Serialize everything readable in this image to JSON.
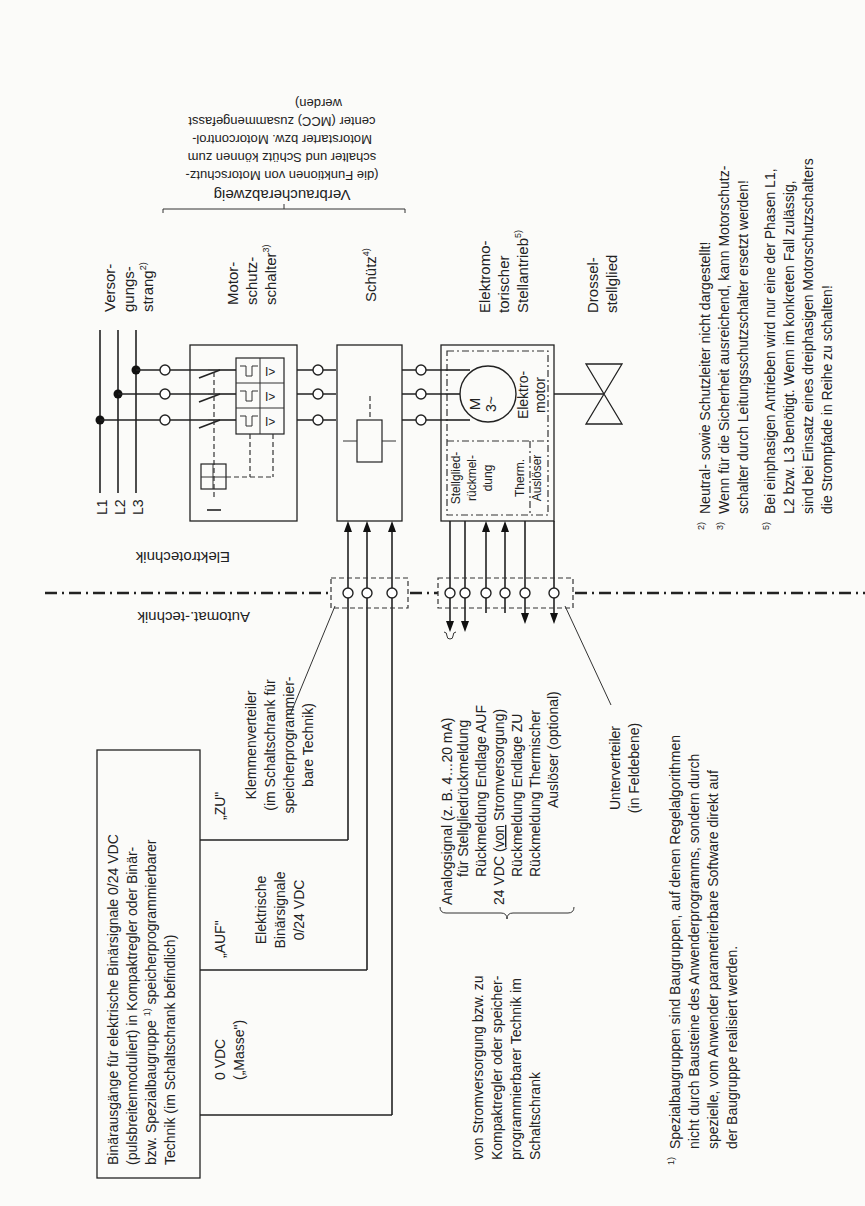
{
  "domains": {
    "upper": "Elektrotechnik",
    "lower": "Automat.-technik"
  },
  "phases": [
    "L1",
    "L2",
    "L3"
  ],
  "components": {
    "versorgung": [
      "Versor-",
      "gungs-",
      "strang"
    ],
    "versorgung_note": "2)",
    "motorschutz": [
      "Motor-",
      "schutz-",
      "schalter"
    ],
    "motorschutz_note": "3)",
    "schuetz": "Schütz",
    "schuetz_note": "4)",
    "stellantrieb": [
      "Elektromo-",
      "torischer",
      "Stellantrieb"
    ],
    "stellantrieb_note": "5)",
    "drossel": [
      "Drossel-",
      "stellglied"
    ],
    "motor_symbol": [
      "M",
      "3~"
    ],
    "motor_label": [
      "Elektro-",
      "motor"
    ],
    "stellglied_rm": [
      "Stellglied-",
      "rückmel-",
      "dung"
    ],
    "therm": [
      "Therm.",
      "Auslöser"
    ]
  },
  "verbraucherabzweig": {
    "title": "Verbraucherabzweig",
    "lines": [
      "(die Funktionen von Motorschutz-",
      "schalter und Schütz können zum",
      "Motorstarter bzw. Motorcontrol-",
      "center (MCC) zusammengefasst",
      "werden)"
    ]
  },
  "control": {
    "binary_outputs_box": [
      "Binärausgänge für elektrische Binärsignale 0/24 VDC",
      "(pulsbreitenmoduliert) in Kompaktregler oder Binär-",
      "bzw. Spezialbaugruppe",
      "speicherprogrammierbarer",
      "Technik (im Schaltschrank befindlich)"
    ],
    "binary_outputs_note": "1)",
    "zu": "„ZU\"",
    "auf": "„AUF\"",
    "masse": [
      "0 VDC",
      "(„Masse\")"
    ],
    "elektrische": [
      "Elektrische",
      "Binärsignale",
      "0/24 VDC"
    ],
    "klemmen": [
      "Klemmenverteiler",
      "(im Schaltschrank für",
      "speicherprogrammier-",
      "bare Technik)"
    ]
  },
  "signals": {
    "lines": [
      "Analogsignal (z. B. 4…20 mA)",
      "für Stellgliedrückmeldung",
      "Rückmeldung Endlage AUF",
      "24 VDC (",
      "von",
      " Stromversorgung)",
      "Rückmeldung Endlage ZU",
      "Rückmeldung Thermischer",
      "Auslöser (optional)"
    ],
    "unterverteiler": [
      "Unterverteiler",
      "(in Feldebene)"
    ],
    "source": [
      "von Stromversorgung bzw. zu",
      "Kompaktregler oder speicher-",
      "programmierbarer Technik im",
      "Schaltschrank"
    ]
  },
  "footnotes": {
    "n1_mark": "1)",
    "n1": [
      "Spezialbaugruppen sind Baugruppen, auf denen Regelalgorithmen",
      "nicht durch Bausteine des Anwenderprogramms, sondern durch",
      "spezielle, vom Anwender parametrierbare Software direkt auf",
      "der Baugruppe realisiert werden."
    ],
    "n2_mark": "2)",
    "n2": [
      "Neutral- sowie Schutzleiter nicht dargestellt!"
    ],
    "n3_mark": "3)",
    "n3": [
      "Wenn für die Sicherheit ausreichend, kann Motorschutz-",
      "schalter durch Leitungsschutzschalter ersetzt werden!"
    ],
    "n5_mark": "5)",
    "n5": [
      "Bei einphasigen Antrieben wird nur eine der Phasen L1,",
      "L2 bzw. L3 benötigt. Wenn im konkreten Fall zulässig,",
      "sind bei Einsatz eines dreiphasigen Motorschutzschalters",
      "die Strompfade in Reihe zu schalten!"
    ]
  }
}
